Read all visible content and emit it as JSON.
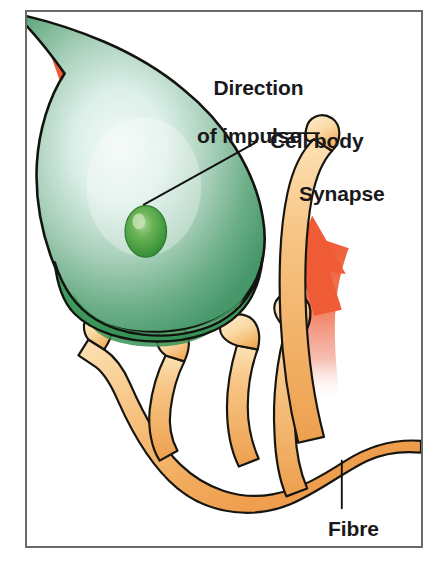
{
  "figure": {
    "frame_border_color": "#6a6a6a",
    "background_color": "#ffffff"
  },
  "labels": {
    "direction_line1": "Direction",
    "direction_line2": "of impulse",
    "cell_body": "Cell body",
    "synapse": "Synapse",
    "fibre": "Fibre"
  },
  "parts": {
    "cell_body": {
      "name": "cell-body",
      "color_edge": "#4e9e70",
      "color_mid": "#79b795",
      "color_center": "#e4f2ee",
      "outline": "#12140f"
    },
    "nucleus": {
      "name": "nucleus",
      "color": "#3f9138",
      "color_highlight": "#8fc47f"
    },
    "fibre": {
      "name": "fibre",
      "color": "#f0a050",
      "color_light": "#fbd79e",
      "outline": "#171510"
    },
    "arrows": {
      "name": "impulse-arrows",
      "color_head": "#ef5b35",
      "color_tail_fade": "#f5b4a4",
      "count": 2,
      "arrow_top_direction": "up-left",
      "arrow_right_direction": "up"
    },
    "leader_lines": {
      "color": "#101010",
      "count": 3
    }
  }
}
